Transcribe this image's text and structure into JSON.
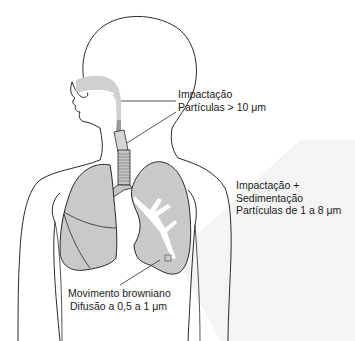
{
  "figure": {
    "colors": {
      "outline": "#2a2a2a",
      "lung_fill": "#c9c9c9",
      "airway_fill": "#d2d2d2",
      "bronchi_fill": "#ffffff",
      "background": "#ffffff",
      "shade_wedge": "#f3f3f3"
    },
    "labels": {
      "upper": {
        "line1": "Impactação",
        "line2": "Partículas > 10 μm"
      },
      "middle": {
        "line1": "Impactação +",
        "line2": "Sedimentação",
        "line3": "Partículas de 1 a 8 μm"
      },
      "lower": {
        "line1": "Movimento browniano",
        "line2": "Difusão a 0,5 a 1 μm"
      }
    }
  }
}
